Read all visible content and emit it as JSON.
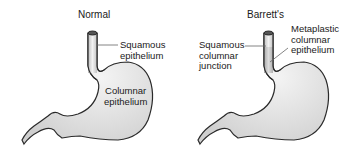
{
  "panels": [
    {
      "title": "Normal",
      "labels": {
        "squamous": [
          "Squamous",
          "epithelium"
        ],
        "columnar": [
          "Columnar",
          "epithelium"
        ]
      }
    },
    {
      "title": "Barrett's",
      "labels": {
        "metaplastic": [
          "Metaplastic",
          "columnar",
          "epithelium"
        ],
        "junction": [
          "Squamous",
          "columnar",
          "junction"
        ]
      }
    }
  ],
  "colors": {
    "outline": "#2a2a2a",
    "fill": "#e4e4e4",
    "shade": "#c8c8c8",
    "lumen": "#555555",
    "leader": "#666666"
  }
}
